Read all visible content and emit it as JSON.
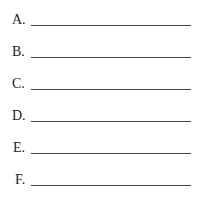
{
  "items": [
    {
      "label": "A.",
      "value": ""
    },
    {
      "label": "B.",
      "value": ""
    },
    {
      "label": "C.",
      "value": ""
    },
    {
      "label": "D.",
      "value": ""
    },
    {
      "label": "E.",
      "value": ""
    },
    {
      "label": "F.",
      "value": ""
    }
  ]
}
